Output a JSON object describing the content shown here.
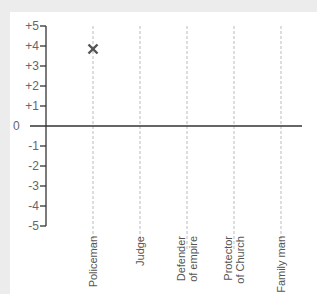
{
  "chart_data": {
    "type": "scatter",
    "title": "",
    "xlabel": "",
    "ylabel": "",
    "ylim": [
      -5,
      5
    ],
    "y_ticks": [
      "+5",
      "+4",
      "+3",
      "+2",
      "+1",
      "0",
      "-1",
      "-2",
      "-3",
      "-4",
      "-5"
    ],
    "categories": [
      [
        "Policeman"
      ],
      [
        "Judge"
      ],
      [
        "Defender",
        "of empire"
      ],
      [
        "Protector",
        "of Church"
      ],
      [
        "Family man"
      ]
    ],
    "grid": "vertical dashed lines per category",
    "series": [
      {
        "name": "rating",
        "marker": "X",
        "points": [
          {
            "category": "Policeman",
            "value": 4
          }
        ]
      }
    ],
    "colors": {
      "axis": "#333333",
      "gridline": "#bbbbbb",
      "marker": "#555555",
      "text": "#666666",
      "background": "#ffffff",
      "frame": "#ececec"
    }
  }
}
